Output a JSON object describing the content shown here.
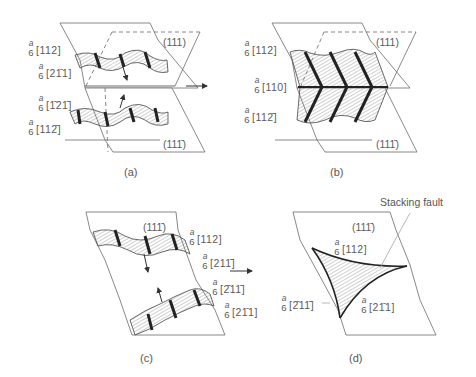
{
  "panels": {
    "a": {
      "caption": "(a)",
      "planes": {
        "top": "(111)",
        "bottom": "(111̄)"
      },
      "burgers": [
        {
          "prefix_num": "a",
          "prefix_den": "6",
          "index": "[112]"
        },
        {
          "prefix_num": "a",
          "prefix_den": "6",
          "index": "[21̄1]"
        },
        {
          "prefix_num": "a",
          "prefix_den": "6",
          "index": "[1̄21̄]"
        },
        {
          "prefix_num": "a",
          "prefix_den": "6",
          "index": "[112̄]"
        }
      ]
    },
    "b": {
      "caption": "(b)",
      "planes": {
        "top": "(111)",
        "bottom": "(111̄)"
      },
      "burgers": [
        {
          "prefix_num": "a",
          "prefix_den": "6",
          "index": "[112]"
        },
        {
          "prefix_num": "a",
          "prefix_den": "6",
          "index": "[110]"
        },
        {
          "prefix_num": "a",
          "prefix_den": "6",
          "index": "[112̄]"
        }
      ]
    },
    "c": {
      "caption": "(c)",
      "planes": {
        "top": "(111̄)"
      },
      "burgers": [
        {
          "prefix_num": "a",
          "prefix_den": "6",
          "index": "[112]"
        },
        {
          "prefix_num": "a",
          "prefix_den": "6",
          "index": "[211̄]"
        },
        {
          "prefix_num": "a",
          "prefix_den": "6",
          "index": "[2̄11̄]"
        },
        {
          "prefix_num": "a",
          "prefix_den": "6",
          "index": "[21̄1]"
        }
      ]
    },
    "d": {
      "caption": "(d)",
      "planes": {
        "top": "(111̄)"
      },
      "annotation": "Stacking fault",
      "burgers": [
        {
          "prefix_num": "a",
          "prefix_den": "6",
          "index": "[112]"
        },
        {
          "prefix_num": "a",
          "prefix_den": "6",
          "index": "[2̄11̄]"
        },
        {
          "prefix_num": "a",
          "prefix_den": "6",
          "index": "[21̄1]"
        }
      ]
    }
  },
  "colors": {
    "line": "#6a6a6a",
    "dark": "#2a2a2a",
    "text": "#5a5a5a"
  }
}
